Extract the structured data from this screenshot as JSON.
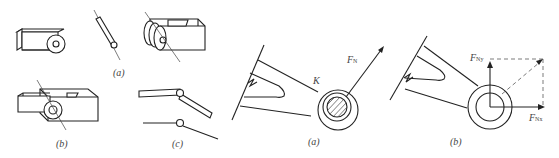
{
  "figure_left": {
    "title": "Pin joint components",
    "captions": {
      "a": "(a)",
      "b": "(b)",
      "c": "(c)"
    }
  },
  "figure_middle": {
    "caption": "(a)",
    "point_label": "K",
    "force_label": "F",
    "force_sub": "N"
  },
  "figure_right": {
    "caption": "(b)",
    "force_y_label": "F",
    "force_y_sub": "Ny",
    "force_x_label": "F",
    "force_x_sub": "Nx"
  },
  "colors": {
    "line": "#222222",
    "background": "#ffffff"
  }
}
